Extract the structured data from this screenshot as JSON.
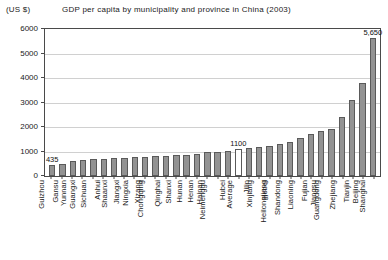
{
  "chart_data": {
    "type": "bar",
    "title": "GDP per capita by municipality and province in China (2003)",
    "unit_label": "(US $)",
    "xlabel": "",
    "ylabel": "",
    "ylim": [
      0,
      6000
    ],
    "yticks": [
      6000,
      5000,
      4000,
      3000,
      2000,
      1000,
      0
    ],
    "ytick_labels": [
      "6000",
      "5000",
      "4000",
      "3000",
      "2000",
      "1000",
      "0"
    ],
    "grid": true,
    "legend": "none",
    "categories": [
      "Guizhou",
      "Gansu",
      "Yunnan",
      "Guangxi",
      "Sichuan",
      "Anhui",
      "Shaanxi",
      "Jiangxi",
      "Ningxia",
      "Xizang",
      "Chongqing",
      "Qinghai",
      "Shanxi",
      "Hunan",
      "Henan",
      "Hainan",
      "Neimenggu",
      "Hubei",
      "Average",
      "Jilin",
      "Xinjiang",
      "Hebei",
      "Heilongjiang",
      "Shandong",
      "Liaoning",
      "Fujian",
      "Jiangsu",
      "Guangdong",
      "Zhejiang",
      "Tianjin",
      "Beijing",
      "Shanghai"
    ],
    "values": [
      435,
      500,
      620,
      640,
      690,
      710,
      730,
      740,
      760,
      770,
      800,
      820,
      840,
      860,
      880,
      960,
      1000,
      1040,
      1100,
      1140,
      1180,
      1240,
      1300,
      1400,
      1550,
      1700,
      1850,
      1930,
      2400,
      3100,
      3800,
      5650
    ],
    "annotations": [
      {
        "category": "Guizhou",
        "label": "435",
        "value": 435
      },
      {
        "category": "Average",
        "label": "1100",
        "value": 1100
      },
      {
        "category": "Shanghai",
        "label": "5,650",
        "value": 5650
      }
    ],
    "highlight_category": "Average",
    "bar_fill_color": "#939393",
    "bar_edge_color": "#5a5a5a",
    "highlight_fill_color": "#ffffff",
    "grid_color": "#d0d0d0",
    "axis_color": "#4a4a4a"
  }
}
